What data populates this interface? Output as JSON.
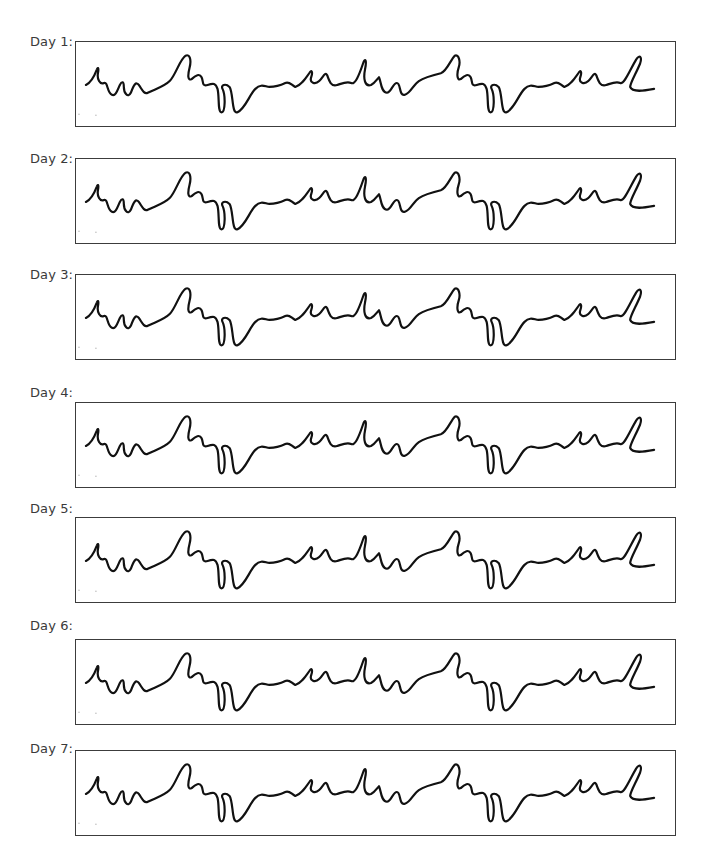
{
  "days": [
    {
      "label": "Day 1:",
      "pattern": "cursive-wave-pattern"
    },
    {
      "label": "Day 2:",
      "pattern": "cursive-wave-pattern"
    },
    {
      "label": "Day 3:",
      "pattern": "cursive-wave-pattern"
    },
    {
      "label": "Day 4:",
      "pattern": "cursive-wave-pattern"
    },
    {
      "label": "Day 5:",
      "pattern": "cursive-wave-pattern"
    },
    {
      "label": "Day 6:",
      "pattern": "cursive-wave-pattern"
    },
    {
      "label": "Day 7:",
      "pattern": "cursive-wave-pattern"
    }
  ],
  "colors": {
    "ink": "#111111",
    "border": "#3c3c3c",
    "label": "#3a3a3a"
  }
}
